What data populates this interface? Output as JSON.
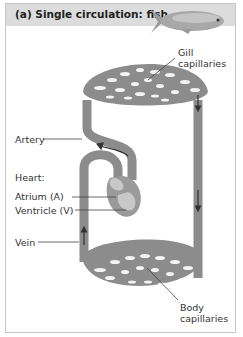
{
  "figure": {
    "title": "(a) Single circulation: fish",
    "icon": "fish-icon"
  },
  "labels": {
    "gill": [
      "Gill",
      "capillaries"
    ],
    "artery": "Artery",
    "heart": "Heart:",
    "atrium": "Atrium (A)",
    "ventricle": "Ventricle (V)",
    "vein": "Vein",
    "body": [
      "Body",
      "capillaries"
    ]
  },
  "colors": {
    "vessel": "#8c8c8c",
    "header_bg": "#dcdcdc",
    "arrow": "#333333"
  }
}
